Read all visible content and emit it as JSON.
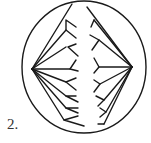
{
  "figure": {
    "label": "2.",
    "colors": {
      "stroke": "#1a1a1a",
      "background": "#ffffff",
      "label": "#333333"
    },
    "cell": {
      "cx": 84,
      "cy": 67,
      "rx": 62,
      "ry": 66
    },
    "poles": {
      "left": [
        32,
        69
      ],
      "right": [
        132,
        67
      ]
    }
  }
}
